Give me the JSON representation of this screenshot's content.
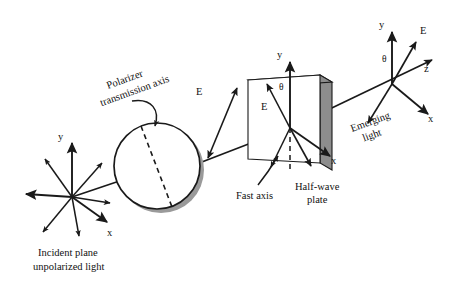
{
  "figure": {
    "background_color": "#ffffff",
    "line_color": "#1a1a1a",
    "shadow_color": "#9a9a9a",
    "plate_edge_color": "#8d8d8d"
  },
  "labels": {
    "incident_caption_line1": "Incident plane",
    "incident_caption_line2": "unpolarized light",
    "polarizer_caption_line1": "Polarizer",
    "polarizer_caption_line2": "transmission axis",
    "fast_axis": "Fast axis",
    "halfwave_line1": "Half-wave",
    "halfwave_line2": "plate",
    "emerging_line1": "Emerging",
    "emerging_line2": "light"
  },
  "incident_frame": {
    "y_axis": "y",
    "x_axis": "x"
  },
  "field_after_polarizer": {
    "e_label": "E"
  },
  "plate_frame": {
    "y_axis": "y",
    "x_axis": "x",
    "e_label": "E",
    "theta": "θ"
  },
  "emerging_frame": {
    "y_axis": "y",
    "x_axis": "x",
    "z_axis": "z",
    "e_label": "E",
    "theta": "θ"
  },
  "icons": {
    "incident_star": "unpolarized-light-star-icon",
    "polarizer_disk": "polarizer-disk-icon",
    "transmission_axis": "dashed-transmission-axis-icon",
    "plate_slab": "half-wave-plate-slab-icon",
    "beam": "light-beam-arrow-icon",
    "pointer_curve": "curved-pointer-arrow-icon"
  }
}
